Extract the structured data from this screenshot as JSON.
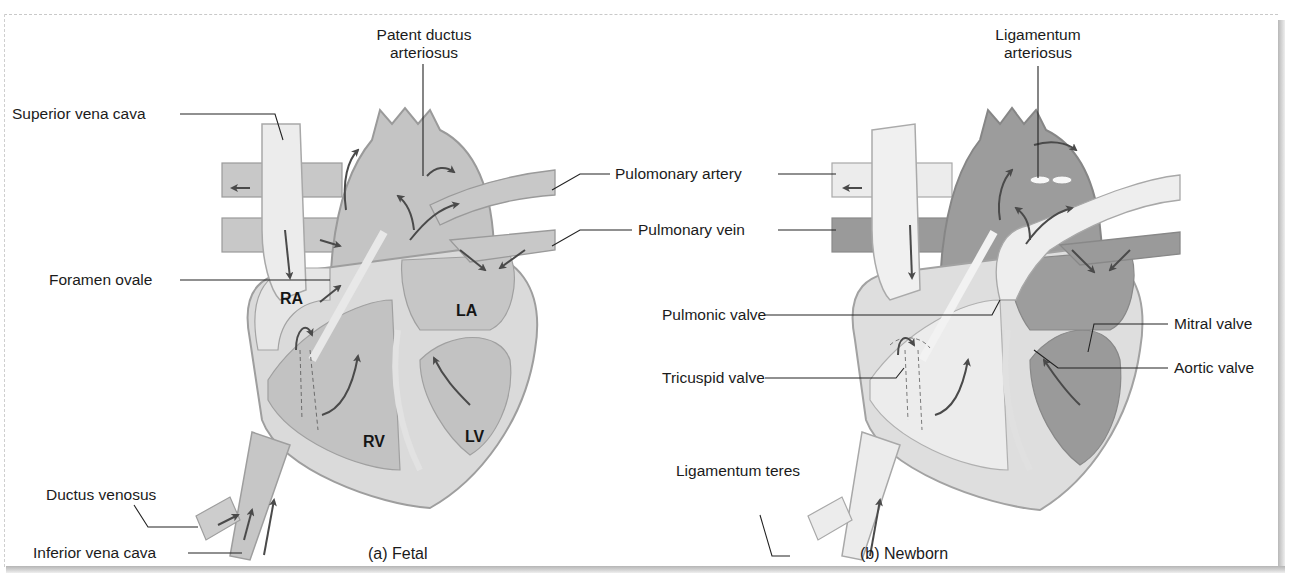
{
  "figure": {
    "panels": [
      {
        "id": "fetal",
        "caption": "(a) Fetal",
        "chambers": {
          "ra": "RA",
          "la": "LA",
          "rv": "RV",
          "lv": "LV"
        },
        "labels": {
          "patent_ductus_line1": "Patent ductus",
          "patent_ductus_line2": "arteriosus",
          "superior_vena_cava": "Superior vena cava",
          "foramen_ovale": "Foramen ovale",
          "ductus_venosus": "Ductus venosus",
          "inferior_vena_cava": "Inferior vena cava"
        }
      },
      {
        "id": "newborn",
        "caption": "(b) Newborn",
        "labels": {
          "ligamentum_arteriosus_line1": "Ligamentum",
          "ligamentum_arteriosus_line2": "arteriosus",
          "mitral_valve": "Mitral valve",
          "aortic_valve": "Aortic valve",
          "ligamentum_teres": "Ligamentum teres"
        }
      }
    ],
    "shared_labels": {
      "pulmonary_artery": "Pulomonary artery",
      "pulmonary_vein": "Pulmonary vein",
      "pulmonic_valve": "Pulmonic valve",
      "tricuspid_valve": "Tricuspid valve"
    },
    "colors": {
      "light_tissue": "#e4e4e4",
      "mid_blood": "#c2c2c2",
      "dark_blood": "#9a9a9a",
      "vessel_wall": "#d6d6d6",
      "outline": "#8a8a8a",
      "arrow": "#4a4a4a",
      "leader": "#222222"
    }
  }
}
